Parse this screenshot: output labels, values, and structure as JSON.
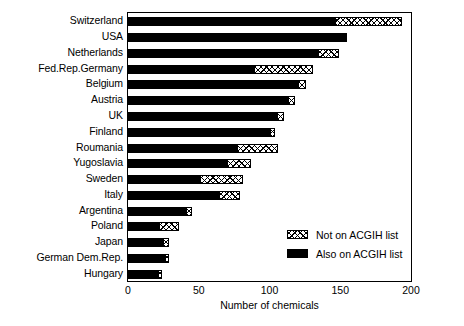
{
  "chart_data": {
    "type": "bar",
    "orientation": "horizontal",
    "stacked": true,
    "title": "",
    "xlabel": "Number of chemicals",
    "ylabel": "",
    "xlim": [
      0,
      200
    ],
    "xticks": [
      0,
      50,
      100,
      150,
      200
    ],
    "xtick_labels": [
      "0",
      "50",
      "100",
      "150",
      "200"
    ],
    "grid": false,
    "legend_position": "inside-lower-right",
    "categories": [
      "Switzerland",
      "USA",
      "Netherlands",
      "Fed.Rep.Germany",
      "Belgium",
      "Austria",
      "UK",
      "Finland",
      "Roumania",
      "Yugoslavia",
      "Sweden",
      "Italy",
      "Argentina",
      "Poland",
      "Japan",
      "German Dem.Rep.",
      "Hungary"
    ],
    "series": [
      {
        "name": "Also on ACGIH list",
        "fill": "solid-black",
        "color": "#000000",
        "values": [
          146,
          155,
          134,
          89,
          120,
          113,
          105,
          100,
          77,
          70,
          51,
          64,
          41,
          22,
          25,
          26,
          21
        ]
      },
      {
        "name": "Not on ACGIH list",
        "fill": "cross-hatch",
        "color": "#ffffff",
        "values": [
          48,
          0,
          15,
          42,
          6,
          5,
          5,
          4,
          29,
          17,
          30,
          15,
          4,
          14,
          4,
          3,
          3
        ]
      }
    ],
    "totals": [
      194,
      155,
      149,
      131,
      126,
      118,
      110,
      104,
      106,
      87,
      81,
      79,
      45,
      36,
      29,
      29,
      24
    ]
  },
  "legend": {
    "items": [
      {
        "label": "Not on ACGIH list",
        "swatch": "cross-hatch"
      },
      {
        "label": "Also on ACGIH list",
        "swatch": "solid-black"
      }
    ]
  }
}
